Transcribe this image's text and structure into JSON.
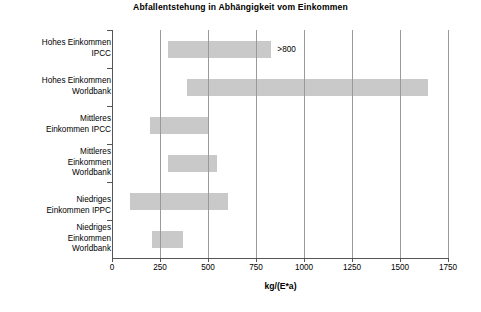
{
  "chart_data": {
    "type": "bar",
    "orientation": "horizontal",
    "subtype": "floating-range-bar",
    "title": "Abfallentstehung in Abhängigkeit vom Einkommen",
    "xlabel": "kg/(E*a)",
    "ylabel": "",
    "xlim": [
      0,
      1750
    ],
    "xticks": [
      0,
      250,
      500,
      750,
      1000,
      1250,
      1500,
      1750
    ],
    "xtick_labels": [
      "0",
      "250",
      "500",
      "750",
      "1000",
      "1250",
      "1500",
      "1750"
    ],
    "grid": "vertical",
    "legend": "none",
    "bar_color": "#c9c9c9",
    "categories": [
      "Hohes Einkommen\nIPCC",
      "Hohes Einkommen\nWorldbank",
      "Mittleres\nEinkommen IPCC",
      "Mittleres\nEinkommen\nWorldbank",
      "Niedriges\nEinkommen IPPC",
      "Niedriges\nEinkommen\nWorldbank"
    ],
    "bars": [
      {
        "category": "Hohes Einkommen IPCC",
        "start": 290,
        "end": 830,
        "annotation": ">800"
      },
      {
        "category": "Hohes Einkommen Worldbank",
        "start": 390,
        "end": 1645,
        "annotation": ""
      },
      {
        "category": "Mittleres Einkommen IPCC",
        "start": 200,
        "end": 500,
        "annotation": ""
      },
      {
        "category": "Mittleres Einkommen Worldbank",
        "start": 290,
        "end": 547,
        "annotation": ""
      },
      {
        "category": "Niedriges Einkommen IPPC",
        "start": 95,
        "end": 605,
        "annotation": ""
      },
      {
        "category": "Niedriges Einkommen Worldbank",
        "start": 208,
        "end": 370,
        "annotation": ""
      }
    ],
    "annotations": [
      {
        "text": ">800",
        "x": 830,
        "category_index": 0
      }
    ]
  }
}
